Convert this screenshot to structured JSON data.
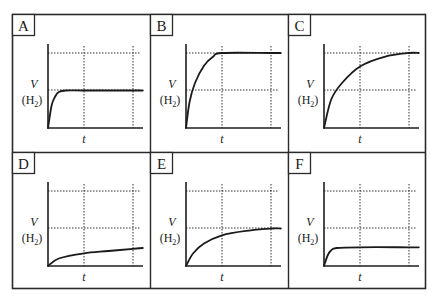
{
  "figure": {
    "y_label_main": "V",
    "y_label_sub_prefix": "(H",
    "y_label_sub_index": "2",
    "y_label_sub_suffix": ")",
    "x_label": "t"
  },
  "panels": [
    {
      "letter": "A",
      "curve": "fast rise, plateau at middle gridline",
      "plateau_level": 0.5,
      "rate": "fast"
    },
    {
      "letter": "B",
      "curve": "steep rise, plateau at upper gridline at first vertical gridline",
      "plateau_level": 1.0,
      "rate": "fast"
    },
    {
      "letter": "C",
      "curve": "gradual rise, reaches upper gridline at second vertical gridline",
      "plateau_level": 1.0,
      "rate": "slow"
    },
    {
      "letter": "D",
      "curve": "slow rise, stays well below middle gridline",
      "plateau_level": 0.25,
      "rate": "slow"
    },
    {
      "letter": "E",
      "curve": "gradual rise, reaches middle gridline at second vertical gridline",
      "plateau_level": 0.5,
      "rate": "slow"
    },
    {
      "letter": "F",
      "curve": "fast rise, plateau below middle gridline",
      "plateau_level": 0.25,
      "rate": "fast"
    }
  ],
  "chart_data": [
    {
      "type": "line",
      "title": "A",
      "xlabel": "t",
      "ylabel": "V (H2)",
      "grid": true,
      "gridlines_y": [
        "middle",
        "upper"
      ],
      "gridlines_x": [
        1,
        2
      ],
      "series": [
        {
          "name": "V(H2)",
          "x": [
            0,
            0.1,
            0.2,
            0.3,
            0.5,
            1,
            2,
            2.2
          ],
          "y": [
            0,
            0.3,
            0.42,
            0.48,
            0.5,
            0.5,
            0.5,
            0.5
          ]
        }
      ],
      "ylim": [
        0,
        1.1
      ],
      "xlim": [
        0,
        2.2
      ]
    },
    {
      "type": "line",
      "title": "B",
      "xlabel": "t",
      "ylabel": "V (H2)",
      "grid": true,
      "gridlines_y": [
        "middle",
        "upper"
      ],
      "gridlines_x": [
        1,
        2
      ],
      "series": [
        {
          "name": "V(H2)",
          "x": [
            0,
            0.1,
            0.25,
            0.5,
            0.75,
            1,
            2,
            2.2
          ],
          "y": [
            0,
            0.35,
            0.6,
            0.83,
            0.95,
            1.0,
            1.0,
            1.0
          ]
        }
      ],
      "ylim": [
        0,
        1.1
      ],
      "xlim": [
        0,
        2.2
      ]
    },
    {
      "type": "line",
      "title": "C",
      "xlabel": "t",
      "ylabel": "V (H2)",
      "grid": true,
      "gridlines_y": [
        "middle",
        "upper"
      ],
      "gridlines_x": [
        1,
        2
      ],
      "series": [
        {
          "name": "V(H2)",
          "x": [
            0,
            0.2,
            0.5,
            1,
            1.5,
            2,
            2.2
          ],
          "y": [
            0,
            0.38,
            0.6,
            0.82,
            0.95,
            1.0,
            1.0
          ]
        }
      ],
      "ylim": [
        0,
        1.1
      ],
      "xlim": [
        0,
        2.2
      ]
    },
    {
      "type": "line",
      "title": "D",
      "xlabel": "t",
      "ylabel": "V (H2)",
      "grid": true,
      "gridlines_y": [
        "middle",
        "upper"
      ],
      "gridlines_x": [
        1,
        2
      ],
      "series": [
        {
          "name": "V(H2)",
          "x": [
            0,
            0.3,
            1,
            1.5,
            2,
            2.2
          ],
          "y": [
            0,
            0.1,
            0.17,
            0.2,
            0.23,
            0.24
          ]
        }
      ],
      "ylim": [
        0,
        1.1
      ],
      "xlim": [
        0,
        2.2
      ]
    },
    {
      "type": "line",
      "title": "E",
      "xlabel": "t",
      "ylabel": "V (H2)",
      "grid": true,
      "gridlines_y": [
        "middle",
        "upper"
      ],
      "gridlines_x": [
        1,
        2
      ],
      "series": [
        {
          "name": "V(H2)",
          "x": [
            0,
            0.2,
            0.5,
            1,
            1.5,
            2,
            2.2
          ],
          "y": [
            0,
            0.17,
            0.3,
            0.41,
            0.47,
            0.5,
            0.5
          ]
        }
      ],
      "ylim": [
        0,
        1.1
      ],
      "xlim": [
        0,
        2.2
      ]
    },
    {
      "type": "line",
      "title": "F",
      "xlabel": "t",
      "ylabel": "V (H2)",
      "grid": true,
      "gridlines_y": [
        "middle",
        "upper"
      ],
      "gridlines_x": [
        1,
        2
      ],
      "series": [
        {
          "name": "V(H2)",
          "x": [
            0,
            0.1,
            0.2,
            0.35,
            1,
            2,
            2.2
          ],
          "y": [
            0,
            0.14,
            0.21,
            0.24,
            0.25,
            0.25,
            0.25
          ]
        }
      ],
      "ylim": [
        0,
        1.1
      ],
      "xlim": [
        0,
        2.2
      ]
    }
  ]
}
